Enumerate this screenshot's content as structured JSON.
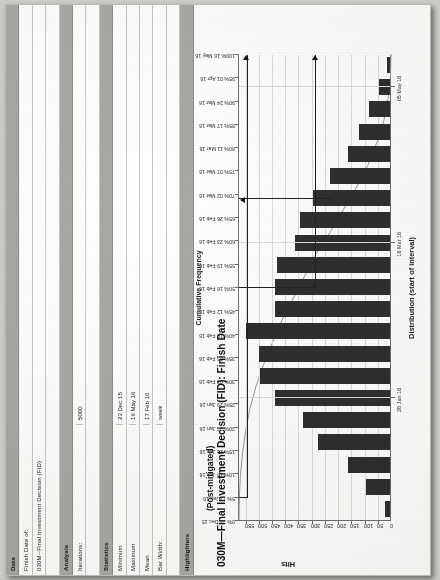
{
  "table": {
    "sections": [
      {
        "name": "Data",
        "rows": [
          {
            "label": "Finish Date of:",
            "value": ""
          },
          {
            "label": "030M--Final Investment Decision (FID)",
            "value": ""
          }
        ]
      },
      {
        "name": "Analysis",
        "rows": [
          {
            "label": "Iterations:",
            "value": "5000"
          }
        ]
      },
      {
        "name": "Statistics",
        "rows": [
          {
            "label": "Minimum",
            "value": "23 Dec 15"
          },
          {
            "label": "Maximum",
            "value": "16 May 16"
          },
          {
            "label": "Mean",
            "value": "17 Feb 16"
          },
          {
            "label": "Bar Width:",
            "value": "week"
          }
        ]
      },
      {
        "name": "Highlighters",
        "rows": [
          {
            "label": "Deterministic (03 Feb 16)",
            "sub": "",
            "value": "31%"
          },
          {
            "label": "5%",
            "value": "11 Jan 16"
          },
          {
            "label": "95%",
            "value": "01 Apr 16"
          },
          {
            "label": "50%",
            "value": "16 Feb 16"
          }
        ]
      }
    ],
    "labels": {
      "data": "Data",
      "analysis": "Analysis",
      "statistics": "Statistics",
      "highlighters": "Highlighters",
      "finish_date_of": "Finish Date of:",
      "activity": "030M--Final Investment Decision (FID)",
      "iterations_label": "Iterations:",
      "iterations_value": "5000",
      "minimum_label": "Minimum",
      "minimum_value": "23 Dec 15",
      "maximum_label": "Maximum",
      "maximum_value": "16 May 16",
      "mean_label": "Mean",
      "mean_value": "17 Feb 16",
      "barwidth_label": "Bar Width:",
      "barwidth_value": "week",
      "det_label": "Deterministic (03 Feb 16)",
      "det_value": "31%",
      "p5_label": "5%",
      "p5_value": "11 Jan 16",
      "p95_label": "95%",
      "p95_value": "01 Apr 16",
      "p50_label": "50%",
      "p50_value": "16 Feb 16"
    }
  },
  "chart_header": {
    "subtitle": "(Post-mitigated)",
    "title": "030M—Final Investment Decision (FID): Finish Date"
  },
  "chart_data": {
    "type": "bar",
    "title": "030M—Final Investment Decision (FID): Finish Date",
    "subtitle": "(Post-mitigated)",
    "xlabel": "Distribution (start of interval)",
    "ylabel": "Hits",
    "y2label": "Cumulative Frequency",
    "ylim": [
      0,
      575
    ],
    "yticks": [
      0,
      50,
      100,
      150,
      200,
      250,
      300,
      350,
      400,
      450,
      500,
      550
    ],
    "xticks": [
      "26 Jan 16",
      "16 Mar 16",
      "05 May 16"
    ],
    "xtick_positions": [
      5,
      12,
      19
    ],
    "grid": true,
    "legend": "none",
    "categories": [
      "23 Dec 15",
      "30 Dec 15",
      "06 Jan 16",
      "13 Jan 16",
      "20 Jan 16",
      "27 Jan 16",
      "03 Feb 16",
      "10 Feb 16",
      "17 Feb 16",
      "24 Feb 16",
      "02 Mar 16",
      "09 Mar 16",
      "16 Mar 16",
      "23 Mar 16",
      "30 Mar 16",
      "06 Apr 16",
      "13 Apr 16",
      "20 Apr 16",
      "27 Apr 16",
      "04 May 16",
      "11 May 16"
    ],
    "values": [
      18,
      92,
      160,
      272,
      328,
      434,
      492,
      494,
      543,
      436,
      434,
      428,
      360,
      340,
      292,
      228,
      158,
      118,
      78,
      42,
      12
    ],
    "cumulative_axis": {
      "label": "Cumulative Frequency",
      "ticks": [
        {
          "pct": "100%",
          "date": "16 May 16"
        },
        {
          "pct": "95%",
          "date": "01 Apr 16"
        },
        {
          "pct": "90%",
          "date": "24 Mar 16"
        },
        {
          "pct": "85%",
          "date": "17 Mar 16"
        },
        {
          "pct": "80%",
          "date": "11 Mar 16"
        },
        {
          "pct": "75%",
          "date": "07 Mar 16"
        },
        {
          "pct": "70%",
          "date": "02 Mar 16"
        },
        {
          "pct": "65%",
          "date": "26 Feb 16"
        },
        {
          "pct": "60%",
          "date": "23 Feb 16"
        },
        {
          "pct": "55%",
          "date": "19 Feb 16"
        },
        {
          "pct": "50%",
          "date": "16 Feb 16"
        },
        {
          "pct": "45%",
          "date": "12 Feb 16"
        },
        {
          "pct": "40%",
          "date": "10 Feb 16"
        },
        {
          "pct": "35%",
          "date": "05 Feb 16"
        },
        {
          "pct": "30%",
          "date": "03 Feb 16"
        },
        {
          "pct": "25%",
          "date": "29 Jan 16"
        },
        {
          "pct": "20%",
          "date": "27 Jan 16"
        },
        {
          "pct": "15%",
          "date": "21 Jan 16"
        },
        {
          "pct": "10%",
          "date": "15 Jan 16"
        },
        {
          "pct": "5%",
          "date": "11 Jan 16"
        },
        {
          "pct": "0%",
          "date": "23 Dec 15"
        }
      ]
    },
    "highlighters": [
      {
        "name": "deterministic",
        "percent": 31,
        "date": "03 Feb 16"
      },
      {
        "name": "p95",
        "percent": 95,
        "date": "01 Apr 16"
      },
      {
        "name": "p50",
        "percent": 50,
        "date": "16 Feb 16"
      }
    ]
  }
}
